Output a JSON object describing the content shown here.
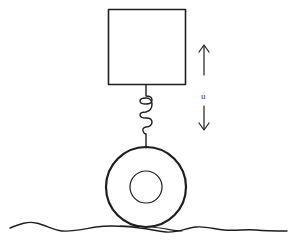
{
  "diagram": {
    "type": "quarter-car suspension model",
    "colors": {
      "ink": "#1e1e1e",
      "background": "#ffffff"
    },
    "elements": {
      "mass_box": {
        "label": ""
      },
      "spring": {
        "label": ""
      },
      "wheel": {
        "label": ""
      },
      "ground": {
        "label": ""
      },
      "displacement_arrow": {
        "label": "u"
      }
    }
  }
}
